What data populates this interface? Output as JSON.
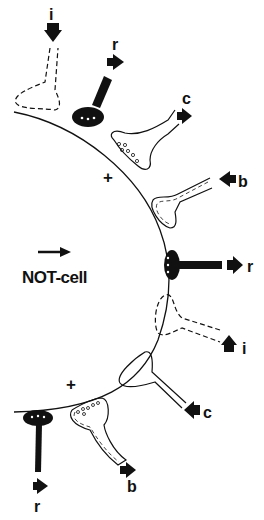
{
  "diagram": {
    "cell_label": "NOT-cell",
    "plus_sign": "+",
    "terminals": [
      {
        "id": "i-top",
        "label": "i",
        "style": "dashed",
        "position": "top-left",
        "arrow": "down"
      },
      {
        "id": "r-top",
        "label": "r",
        "style": "solid-black",
        "position": "top",
        "arrow": "right"
      },
      {
        "id": "c-top",
        "label": "c",
        "style": "outline-vesicles",
        "position": "upper-right",
        "arrow": "right"
      },
      {
        "id": "b-upper",
        "label": "b",
        "style": "double-dashed",
        "position": "right-upper",
        "arrow": "left"
      },
      {
        "id": "r-mid",
        "label": "r",
        "style": "solid-black",
        "position": "right-middle",
        "arrow": "right"
      },
      {
        "id": "i-lower",
        "label": "i",
        "style": "dashed",
        "position": "right-lower",
        "arrow": "up"
      },
      {
        "id": "c-lower",
        "label": "c",
        "style": "outline",
        "position": "lower-right",
        "arrow": "left"
      },
      {
        "id": "b-bottom",
        "label": "b",
        "style": "double-dashed-vesicles",
        "position": "bottom",
        "arrow": "right"
      },
      {
        "id": "r-bottom",
        "label": "r",
        "style": "solid-black",
        "position": "bottom-left",
        "arrow": "right"
      }
    ],
    "labels": {
      "i_top": "i",
      "r_top": "r",
      "c_top": "c",
      "b_upper": "b",
      "r_mid": "r",
      "i_lower": "i",
      "c_lower": "c",
      "b_bottom": "b",
      "r_bottom": "r",
      "plus_top": "+",
      "plus_bottom": "+"
    },
    "colors": {
      "ink": "#111111",
      "background": "#ffffff"
    }
  }
}
